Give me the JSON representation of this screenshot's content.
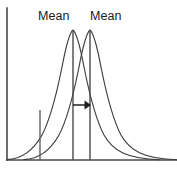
{
  "figure": {
    "background_color": "#ffffff",
    "stroke_color": "#3d3d3d",
    "axis_color": "#4a4a4a",
    "arrow_color": "#1f1f1f",
    "text_color": "#1a1a1a",
    "width": 177,
    "height": 172
  },
  "labels": {
    "mean_left": "Mean",
    "mean_right": "Mean"
  },
  "chart_data": {
    "type": "line",
    "title": "",
    "subtitle": "",
    "xlabel": "",
    "ylabel": "",
    "grid": false,
    "legend_position": "none",
    "axis": {
      "y_axis_x": 7,
      "y_axis_top": 8,
      "y_axis_bottom": 160,
      "x_axis_y": 160,
      "x_axis_left": 7,
      "x_axis_right": 177,
      "x_range": [
        0,
        177
      ],
      "y_range": [
        0,
        172
      ],
      "ticks": [],
      "tick_labels": []
    },
    "series": [
      {
        "name": "distribution-left",
        "kind": "normal-curve",
        "peak_x": 73,
        "peak_y": 30,
        "mean_label": "Mean",
        "baseline_y": 160,
        "left_tail_x": 7,
        "right_tail_x": 160,
        "path": "M 7 159.6 C 22 159 33 151 42 135 C 51 118 57 92 62 67 C 66 46 69 33 73 30 C 77 33 80 46 84 67 C 89 92 95 118 104 135 C 113 151 127 159 160 159.8"
      },
      {
        "name": "distribution-right",
        "kind": "normal-curve",
        "peak_x": 90,
        "peak_y": 30,
        "mean_label": "Mean",
        "baseline_y": 160,
        "left_tail_x": 24,
        "right_tail_x": 177,
        "path": "M 24 159.6 C 39 159 50 151 59 135 C 68 118 74 92 79 67 C 83 46 86 33 90 30 C 94 33 97 46 101 67 C 106 92 112 118 121 135 C 130 151 144 159 177 159.8"
      }
    ],
    "mean_lines": [
      {
        "name": "mean-line-left",
        "x": 73,
        "y_top": 30,
        "y_bottom": 160
      },
      {
        "name": "mean-line-right",
        "x": 90,
        "y_top": 30,
        "y_bottom": 160
      }
    ],
    "reference_lines": [
      {
        "name": "reference-marker-left",
        "x": 40,
        "y_top": 110,
        "y_bottom": 160
      }
    ],
    "annotations": [
      {
        "name": "mean-shift-arrow",
        "type": "arrow",
        "direction": "right",
        "x_start": 73,
        "x_end": 91,
        "y": 105,
        "meaning": "shift of the mean"
      }
    ]
  }
}
